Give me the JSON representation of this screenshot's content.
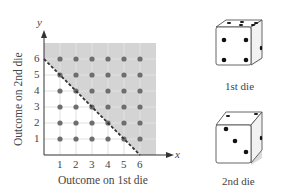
{
  "chart_data": {
    "type": "scatter",
    "title": "",
    "xlabel": "Outcome on 1st die",
    "ylabel": "Outcome on 2nd die",
    "x_axis_symbol": "x",
    "y_axis_symbol": "y",
    "x_ticks": [
      "1",
      "2",
      "3",
      "4",
      "5",
      "6"
    ],
    "y_ticks": [
      "1",
      "2",
      "3",
      "4",
      "5",
      "6"
    ],
    "xlim": [
      0,
      7
    ],
    "ylim": [
      0,
      7
    ],
    "grid": true,
    "points": "all (x, y) with x in 1..6 and y in 1..6 (36 points)",
    "boundary_line": {
      "equation": "x + y = 6",
      "style": "dashed",
      "from": [
        0,
        6
      ],
      "to": [
        6,
        0
      ]
    },
    "shaded_region": "x + y > 6 (above dashed line, within 0..7 square)"
  },
  "colors": {
    "shade": "#d4d4d4",
    "grid": "#e2e2e2",
    "dot": "#6e6e6e",
    "axis": "#333333"
  },
  "dice": [
    {
      "caption": "1st die",
      "top_face": 5,
      "front_face": 4
    },
    {
      "caption": "2nd die",
      "top_face": 2,
      "front_face": 3
    }
  ]
}
